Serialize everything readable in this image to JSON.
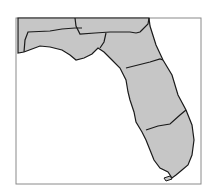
{
  "map": {
    "title": "",
    "subject": "Florida regions",
    "land_color": "#c6c6c6",
    "border_color": "#1a1a1a",
    "frame_color": "#8a8a8a",
    "water_color": "#ffffff",
    "region_count": 5
  }
}
